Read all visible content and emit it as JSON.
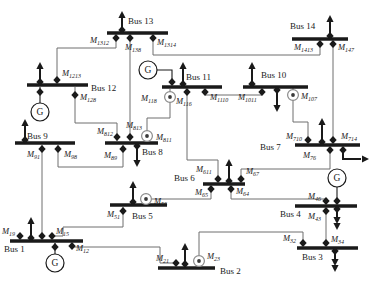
{
  "diagram": {
    "canvas": {
      "w": 381,
      "h": 305,
      "bg": "#ffffff"
    },
    "colors": {
      "ink": "#1a1a1a",
      "wire": "#6e6e6e",
      "meter_ring": "#8a8a8a",
      "meter_dot": "#3a3a3a"
    },
    "buses": [
      {
        "id": "bus1",
        "label": "Bus 1",
        "x1": 10,
        "x2": 83,
        "y": 241,
        "lx": 4,
        "ly": 252
      },
      {
        "id": "bus2",
        "label": "Bus 2",
        "x1": 158,
        "x2": 215,
        "y": 268,
        "lx": 220,
        "ly": 274
      },
      {
        "id": "bus3",
        "label": "Bus 3",
        "x1": 297,
        "x2": 358,
        "y": 248,
        "lx": 302,
        "ly": 260
      },
      {
        "id": "bus4",
        "label": "Bus 4",
        "x1": 295,
        "x2": 357,
        "y": 206,
        "lx": 280,
        "ly": 217
      },
      {
        "id": "bus5",
        "label": "Bus 5",
        "x1": 110,
        "x2": 167,
        "y": 205,
        "lx": 132,
        "ly": 219
      },
      {
        "id": "bus6",
        "label": "Bus 6",
        "x1": 203,
        "x2": 245,
        "y": 184,
        "lx": 174,
        "ly": 181
      },
      {
        "id": "bus7",
        "label": "Bus 7",
        "x1": 295,
        "x2": 360,
        "y": 145,
        "lx": 260,
        "ly": 150
      },
      {
        "id": "bus8",
        "label": "Bus 8",
        "x1": 105,
        "x2": 158,
        "y": 143,
        "lx": 142,
        "ly": 155
      },
      {
        "id": "bus9",
        "label": "Bus 9",
        "x1": 15,
        "x2": 75,
        "y": 143,
        "lx": 27,
        "ly": 139
      },
      {
        "id": "bus10",
        "label": "Bus 10",
        "x1": 243,
        "x2": 308,
        "y": 87,
        "lx": 261,
        "ly": 78
      },
      {
        "id": "bus11",
        "label": "Bus 11",
        "x1": 162,
        "x2": 222,
        "y": 87,
        "lx": 186,
        "ly": 80
      },
      {
        "id": "bus12",
        "label": "Bus 12",
        "x1": 27,
        "x2": 88,
        "y": 85,
        "lx": 91,
        "ly": 91
      },
      {
        "id": "bus13",
        "label": "Bus 13",
        "x1": 107,
        "x2": 168,
        "y": 33,
        "lx": 128,
        "ly": 24
      },
      {
        "id": "bus14",
        "label": "Bus 14",
        "x1": 292,
        "x2": 348,
        "y": 39,
        "lx": 290,
        "ly": 29
      }
    ],
    "measurements": [
      {
        "id": "M1312",
        "label": "M",
        "sub": "1312",
        "kind": "diamond",
        "x": 116,
        "y": 38,
        "lx": 90,
        "ly": 43
      },
      {
        "id": "M138",
        "label": "M",
        "sub": "138",
        "kind": "diamond",
        "x": 130,
        "y": 38,
        "lx": 125,
        "ly": 50
      },
      {
        "id": "M1314",
        "label": "M",
        "sub": "1314",
        "kind": "diamond",
        "x": 153,
        "y": 38,
        "lx": 157,
        "ly": 45
      },
      {
        "id": "M1413",
        "label": "M",
        "sub": "1413",
        "kind": "diamond",
        "x": 320,
        "y": 44,
        "lx": 294,
        "ly": 50
      },
      {
        "id": "M147",
        "label": "M",
        "sub": "147",
        "kind": "diamond",
        "x": 333,
        "y": 44,
        "lx": 338,
        "ly": 50
      },
      {
        "id": "M1213",
        "label": "M",
        "sub": "1213",
        "kind": "diamond",
        "x": 57,
        "y": 80,
        "lx": 62,
        "ly": 76
      },
      {
        "id": "M128",
        "label": "M",
        "sub": "128",
        "kind": "diamond",
        "x": 75,
        "y": 95,
        "lx": 80,
        "ly": 100
      },
      {
        "id": "M118",
        "label": "M",
        "sub": "118",
        "kind": "meter",
        "x": 170,
        "y": 97,
        "lx": 141,
        "ly": 101
      },
      {
        "id": "M116",
        "label": "M",
        "sub": "116",
        "kind": "diamond",
        "x": 187,
        "y": 92,
        "lx": 176,
        "ly": 104
      },
      {
        "id": "M1110",
        "label": "M",
        "sub": "1110",
        "kind": "diamond",
        "x": 205,
        "y": 92,
        "lx": 210,
        "ly": 100
      },
      {
        "id": "M1011",
        "label": "M",
        "sub": "1011",
        "kind": "diamond",
        "x": 262,
        "y": 92,
        "lx": 238,
        "ly": 100
      },
      {
        "id": "M107",
        "label": "M",
        "sub": "107",
        "kind": "meter",
        "x": 293,
        "y": 95,
        "lx": 301,
        "ly": 99
      },
      {
        "id": "M91",
        "label": "M",
        "sub": "91",
        "kind": "diamond",
        "x": 42,
        "y": 149,
        "lx": 27,
        "ly": 157
      },
      {
        "id": "M98",
        "label": "M",
        "sub": "98",
        "kind": "diamond",
        "x": 58,
        "y": 149,
        "lx": 64,
        "ly": 157
      },
      {
        "id": "M812",
        "label": "M",
        "sub": "812",
        "kind": "diamond",
        "x": 117,
        "y": 137,
        "lx": 97,
        "ly": 134
      },
      {
        "id": "M813",
        "label": "M",
        "sub": "813",
        "kind": "diamond",
        "x": 130,
        "y": 137,
        "lx": 126,
        "ly": 128
      },
      {
        "id": "M811",
        "label": "M",
        "sub": "811",
        "kind": "meter",
        "x": 147,
        "y": 136,
        "lx": 156,
        "ly": 140
      },
      {
        "id": "M89",
        "label": "M",
        "sub": "89",
        "kind": "diamond",
        "x": 123,
        "y": 149,
        "lx": 104,
        "ly": 158
      },
      {
        "id": "M710",
        "label": "M",
        "sub": "710",
        "kind": "diamond",
        "x": 308,
        "y": 140,
        "lx": 286,
        "ly": 139
      },
      {
        "id": "M714",
        "label": "M",
        "sub": "714",
        "kind": "diamond",
        "x": 333,
        "y": 140,
        "lx": 341,
        "ly": 139
      },
      {
        "id": "M76",
        "label": "M",
        "sub": "76",
        "kind": "diamond",
        "x": 330,
        "y": 150,
        "lx": 303,
        "ly": 158
      },
      {
        "id": "M611",
        "label": "M",
        "sub": "611",
        "kind": "diamond",
        "x": 218,
        "y": 179,
        "lx": 196,
        "ly": 172
      },
      {
        "id": "M67",
        "label": "M",
        "sub": "67",
        "kind": "diamond",
        "x": 241,
        "y": 179,
        "lx": 246,
        "ly": 174
      },
      {
        "id": "M65",
        "label": "M",
        "sub": "65",
        "kind": "diamond",
        "x": 211,
        "y": 189,
        "lx": 195,
        "ly": 195
      },
      {
        "id": "M64",
        "label": "M",
        "sub": "64",
        "kind": "diamond",
        "x": 231,
        "y": 189,
        "lx": 236,
        "ly": 194
      },
      {
        "id": "M56",
        "label": "M",
        "sub": "56",
        "kind": "meter",
        "x": 146,
        "y": 199,
        "lx": 154,
        "ly": 204
      },
      {
        "id": "M51",
        "label": "M",
        "sub": "51",
        "kind": "diamond",
        "x": 123,
        "y": 211,
        "lx": 107,
        "ly": 217
      },
      {
        "id": "M46",
        "label": "M",
        "sub": "46",
        "kind": "diamond",
        "x": 326,
        "y": 201,
        "lx": 308,
        "ly": 199
      },
      {
        "id": "M43",
        "label": "M",
        "sub": "43",
        "kind": "diamond",
        "x": 326,
        "y": 211,
        "lx": 308,
        "ly": 219
      },
      {
        "id": "M32",
        "label": "M",
        "sub": "32",
        "kind": "diamond",
        "x": 303,
        "y": 243,
        "lx": 283,
        "ly": 241
      },
      {
        "id": "M34",
        "label": "M",
        "sub": "34",
        "kind": "diamond",
        "x": 326,
        "y": 243,
        "lx": 331,
        "ly": 242
      },
      {
        "id": "M21",
        "label": "M",
        "sub": "21",
        "kind": "diamond",
        "x": 176,
        "y": 263,
        "lx": 156,
        "ly": 261
      },
      {
        "id": "M23",
        "label": "M",
        "sub": "23",
        "kind": "meter",
        "x": 199,
        "y": 261,
        "lx": 207,
        "ly": 259
      },
      {
        "id": "M19",
        "label": "M",
        "sub": "19",
        "kind": "diamond",
        "x": 20,
        "y": 236,
        "lx": 2,
        "ly": 234
      },
      {
        "id": "M15",
        "label": "M",
        "sub": "15",
        "kind": "diamond",
        "x": 52,
        "y": 236,
        "lx": 56,
        "ly": 234
      },
      {
        "id": "M12",
        "label": "M",
        "sub": "12",
        "kind": "diamond",
        "x": 72,
        "y": 246,
        "lx": 76,
        "ly": 251
      }
    ],
    "junctions": [
      [
        42,
        236
      ]
    ],
    "wires": [
      {
        "name": "wire-bus13-bus12",
        "points": [
          [
            116,
            35
          ],
          [
            116,
            48
          ],
          [
            57,
            48
          ],
          [
            57,
            83
          ]
        ]
      },
      {
        "name": "wire-bus13-bus8",
        "points": [
          [
            130,
            35
          ],
          [
            130,
            141
          ]
        ]
      },
      {
        "name": "wire-bus13-bus14",
        "points": [
          [
            153,
            35
          ],
          [
            153,
            55
          ],
          [
            320,
            55
          ],
          [
            320,
            41
          ]
        ]
      },
      {
        "name": "wire-bus14-bus7",
        "points": [
          [
            333,
            41
          ],
          [
            333,
            143
          ]
        ]
      },
      {
        "name": "wire-bus12-bus8",
        "points": [
          [
            75,
            87
          ],
          [
            75,
            123
          ],
          [
            117,
            123
          ],
          [
            117,
            141
          ]
        ]
      },
      {
        "name": "wire-bus11-bus10",
        "points": [
          [
            205,
            89
          ],
          [
            205,
            95
          ],
          [
            262,
            95
          ],
          [
            262,
            89
          ]
        ]
      },
      {
        "name": "wire-bus11-bus8",
        "points": [
          [
            170,
            89
          ],
          [
            170,
            118
          ],
          [
            147,
            118
          ],
          [
            147,
            141
          ]
        ]
      },
      {
        "name": "wire-bus11-bus6",
        "points": [
          [
            187,
            89
          ],
          [
            187,
            160
          ],
          [
            218,
            160
          ],
          [
            218,
            182
          ]
        ]
      },
      {
        "name": "wire-bus10-bus7",
        "points": [
          [
            293,
            88
          ],
          [
            293,
            122
          ],
          [
            308,
            122
          ],
          [
            308,
            143
          ]
        ]
      },
      {
        "name": "wire-bus9-bus8",
        "points": [
          [
            58,
            145
          ],
          [
            58,
            167
          ],
          [
            123,
            167
          ],
          [
            123,
            145
          ]
        ]
      },
      {
        "name": "wire-bus9-bus1",
        "points": [
          [
            42,
            145
          ],
          [
            42,
            239
          ]
        ]
      },
      {
        "name": "wire-bus7-bus6",
        "points": [
          [
            330,
            147
          ],
          [
            330,
            169
          ],
          [
            241,
            169
          ],
          [
            241,
            182
          ]
        ]
      },
      {
        "name": "wire-bus6-bus5",
        "points": [
          [
            211,
            186
          ],
          [
            211,
            199
          ],
          [
            152,
            199
          ]
        ]
      },
      {
        "name": "wire-bus6-bus4",
        "points": [
          [
            231,
            186
          ],
          [
            231,
            199
          ],
          [
            326,
            199
          ],
          [
            326,
            204
          ]
        ]
      },
      {
        "name": "wire-bus5-bus1",
        "points": [
          [
            123,
            207
          ],
          [
            123,
            227
          ],
          [
            63,
            227
          ],
          [
            63,
            236
          ],
          [
            52,
            236
          ],
          [
            52,
            239
          ]
        ]
      },
      {
        "name": "wire-bus1-bus2",
        "points": [
          [
            72,
            243
          ],
          [
            72,
            247
          ],
          [
            160,
            247
          ],
          [
            160,
            263
          ],
          [
            176,
            263
          ],
          [
            176,
            266
          ]
        ]
      },
      {
        "name": "wire-bus2-bus3",
        "points": [
          [
            199,
            255
          ],
          [
            199,
            232
          ],
          [
            303,
            232
          ],
          [
            303,
            246
          ]
        ]
      },
      {
        "name": "wire-bus3-bus4",
        "points": [
          [
            326,
            246
          ],
          [
            326,
            208
          ]
        ]
      }
    ],
    "generators": [
      {
        "id": "gen-bus1",
        "label": "G",
        "cx": 55,
        "cy": 263,
        "r": 9,
        "stem": [
          [
            55,
            243
          ],
          [
            55,
            254
          ]
        ],
        "diamond": [
          55,
          247
        ]
      },
      {
        "id": "gen-bus12",
        "label": "G",
        "cx": 40,
        "cy": 112,
        "r": 9,
        "stem": [
          [
            40,
            87
          ],
          [
            40,
            103
          ]
        ],
        "diamond": [
          40,
          92
        ]
      },
      {
        "id": "gen-bus11",
        "label": "G",
        "cx": 148,
        "cy": 70,
        "r": 9,
        "stem": [
          [
            157,
            70
          ],
          [
            172,
            70
          ],
          [
            172,
            85
          ]
        ],
        "diamond": [
          172,
          82
        ]
      },
      {
        "id": "gen-bus4",
        "label": "G",
        "cx": 337,
        "cy": 178,
        "r": 9,
        "stem": [
          [
            337,
            187
          ],
          [
            337,
            204
          ]
        ],
        "diamond": [
          337,
          201
        ]
      }
    ],
    "arrows": [
      {
        "id": "load-bus13",
        "dir": "up",
        "x": 122,
        "y0": 31,
        "y1": 11,
        "double": false
      },
      {
        "id": "load-bus14",
        "dir": "up",
        "x": 330,
        "y0": 37,
        "y1": 15,
        "double": false
      },
      {
        "id": "load-bus12",
        "dir": "up",
        "x": 40,
        "y0": 83,
        "y1": 62,
        "double": false
      },
      {
        "id": "load-bus11",
        "dir": "up",
        "x": 183,
        "y0": 85,
        "y1": 62,
        "double": false
      },
      {
        "id": "load-bus10-up",
        "dir": "up",
        "x": 252,
        "y0": 85,
        "y1": 62,
        "double": false
      },
      {
        "id": "load-bus10-down",
        "dir": "down",
        "x": 277,
        "y0": 89,
        "y1": 112,
        "double": false
      },
      {
        "id": "load-bus9",
        "dir": "up",
        "x": 25,
        "y0": 141,
        "y1": 119,
        "double": false
      },
      {
        "id": "load-bus8",
        "dir": "down",
        "x": 137,
        "y0": 145,
        "y1": 167,
        "double": false
      },
      {
        "id": "load-bus7-up",
        "dir": "up",
        "x": 322,
        "y0": 143,
        "y1": 118,
        "double": false
      },
      {
        "id": "load-bus7-right",
        "dir": "right",
        "path": [
          [
            343,
            147
          ],
          [
            343,
            159
          ],
          [
            361,
            159
          ]
        ],
        "tip": [
          369,
          159
        ]
      },
      {
        "id": "load-bus6",
        "dir": "up",
        "x": 229,
        "y0": 182,
        "y1": 159,
        "double": false
      },
      {
        "id": "load-bus5",
        "dir": "up",
        "x": 133,
        "y0": 203,
        "y1": 181,
        "double": false
      },
      {
        "id": "load-bus4",
        "dir": "down",
        "x": 337,
        "y0": 208,
        "y1": 230,
        "double": true
      },
      {
        "id": "load-bus3",
        "dir": "down",
        "x": 335,
        "y0": 250,
        "y1": 272,
        "double": true
      },
      {
        "id": "load-bus2",
        "dir": "up",
        "x": 185,
        "y0": 265,
        "y1": 243,
        "double": false
      },
      {
        "id": "load-bus1",
        "dir": "up",
        "x": 31,
        "y0": 239,
        "y1": 217,
        "double": false
      }
    ]
  }
}
